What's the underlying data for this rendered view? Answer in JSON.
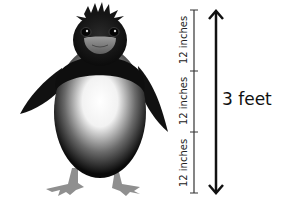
{
  "diagram": {
    "scale": {
      "segments": [
        {
          "label": "12 inches"
        },
        {
          "label": "12 inches"
        },
        {
          "label": "12 inches"
        }
      ],
      "total_label": "3 feet"
    },
    "colors": {
      "body": "#111111",
      "belly_highlight": "#ffffff",
      "beak": "#8a8a8a",
      "feet": "#8f8f8f",
      "scale_line": "#333333",
      "arrow": "#111111"
    }
  }
}
